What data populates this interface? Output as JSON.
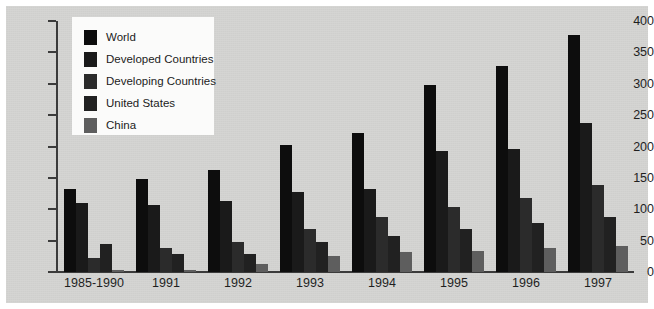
{
  "chart_data": {
    "type": "bar",
    "title": "",
    "subtitle": "",
    "xlabel": "",
    "ylabel": "",
    "ylim": [
      0,
      400
    ],
    "ytick_step": 50,
    "yticks": [
      400,
      350,
      300,
      250,
      200,
      150,
      100,
      50,
      0
    ],
    "grid": false,
    "legend_position": "top-left",
    "categories": [
      "1985-1990",
      "1991",
      "1992",
      "1993",
      "1994",
      "1995",
      "1996",
      "1997"
    ],
    "series": [
      {
        "name": "World",
        "color": "#0d0d0d",
        "values": [
          132,
          149,
          163,
          203,
          222,
          298,
          328,
          377
        ]
      },
      {
        "name": "Developed Countries",
        "color": "#1a1a1a",
        "values": [
          110,
          107,
          113,
          128,
          133,
          193,
          196,
          237
        ]
      },
      {
        "name": "Developing Countries",
        "color": "#2b2b2b",
        "values": [
          22,
          38,
          48,
          68,
          88,
          103,
          118,
          138
        ]
      },
      {
        "name": "United States",
        "color": "#212121",
        "values": [
          45,
          28,
          28,
          48,
          58,
          68,
          78,
          88
        ]
      },
      {
        "name": "China",
        "color": "#5e5e5e",
        "values": [
          4,
          4,
          12,
          25,
          32,
          33,
          38,
          42
        ]
      }
    ]
  },
  "legend": {
    "items": [
      {
        "label": "World"
      },
      {
        "label": "Developed Countries"
      },
      {
        "label": "Developing Countries"
      },
      {
        "label": "United States"
      },
      {
        "label": "China"
      }
    ]
  },
  "axes": {
    "y_tick_labels": [
      "400",
      "350",
      "300",
      "250",
      "200",
      "150",
      "100",
      "50",
      "0"
    ],
    "x_tick_labels": [
      "1985-1990",
      "1991",
      "1992",
      "1993",
      "1994",
      "1995",
      "1996",
      "1997"
    ]
  },
  "colors": {
    "canvas_background": "#d4d4d2",
    "page_background": "#ffffff",
    "axis": "#3b3b3b",
    "text": "#1f1f1f",
    "legend_background": "#fbfbfa"
  }
}
